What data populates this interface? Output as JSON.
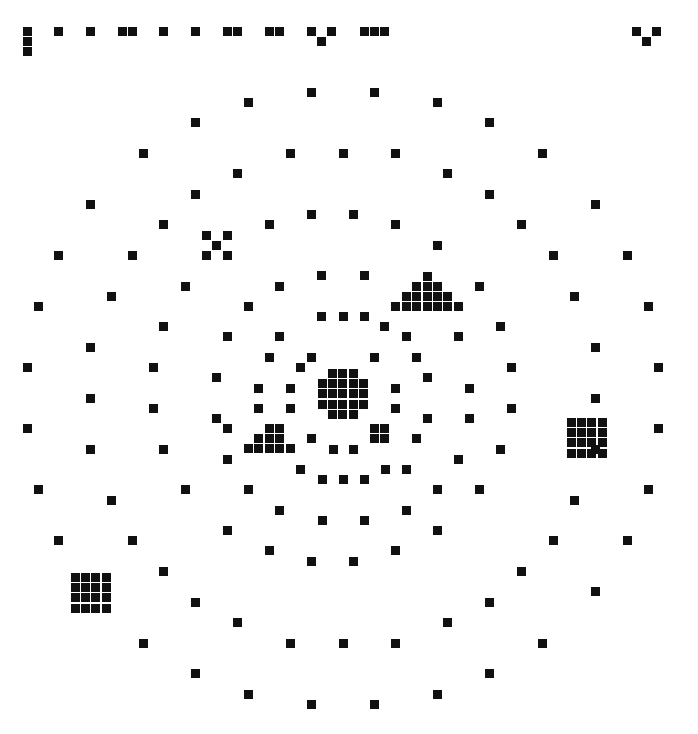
{
  "canvas": {
    "width": 698,
    "height": 734,
    "background": "#ffffff",
    "ink": "#111111",
    "square_size": 9
  },
  "header_row": {
    "description": "row of markers along top edge",
    "points": [
      [
        27,
        31
      ],
      [
        27,
        41
      ],
      [
        27,
        51
      ],
      [
        58,
        31
      ],
      [
        90,
        31
      ],
      [
        122,
        31
      ],
      [
        132,
        31
      ],
      [
        163,
        31
      ],
      [
        195,
        31
      ],
      [
        227,
        31
      ],
      [
        237,
        31
      ],
      [
        269,
        31
      ],
      [
        279,
        31
      ],
      [
        311,
        31
      ],
      [
        321,
        41
      ],
      [
        331,
        31
      ],
      [
        364,
        31
      ],
      [
        374,
        31
      ],
      [
        384,
        31
      ],
      [
        636,
        31
      ],
      [
        646,
        41
      ],
      [
        656,
        31
      ]
    ]
  },
  "scatter_points": [
    [
      311,
      92
    ],
    [
      374,
      92
    ],
    [
      248,
      102
    ],
    [
      437,
      102
    ],
    [
      195,
      122
    ],
    [
      489,
      122
    ],
    [
      143,
      153
    ],
    [
      290,
      153
    ],
    [
      343,
      153
    ],
    [
      395,
      153
    ],
    [
      542,
      153
    ],
    [
      237,
      173
    ],
    [
      447,
      173
    ],
    [
      195,
      194
    ],
    [
      489,
      194
    ],
    [
      90,
      204
    ],
    [
      595,
      204
    ],
    [
      311,
      214
    ],
    [
      353,
      214
    ],
    [
      163,
      224
    ],
    [
      269,
      224
    ],
    [
      395,
      224
    ],
    [
      521,
      224
    ],
    [
      437,
      245
    ],
    [
      58,
      255
    ],
    [
      132,
      255
    ],
    [
      227,
      255
    ],
    [
      553,
      255
    ],
    [
      627,
      255
    ],
    [
      321,
      275
    ],
    [
      364,
      275
    ],
    [
      185,
      286
    ],
    [
      279,
      286
    ],
    [
      479,
      286
    ],
    [
      111,
      296
    ],
    [
      574,
      296
    ],
    [
      38,
      306
    ],
    [
      248,
      306
    ],
    [
      648,
      306
    ],
    [
      321,
      316
    ],
    [
      343,
      316
    ],
    [
      364,
      316
    ],
    [
      163,
      326
    ],
    [
      384,
      326
    ],
    [
      500,
      326
    ],
    [
      279,
      336
    ],
    [
      227,
      336
    ],
    [
      458,
      336
    ],
    [
      90,
      347
    ],
    [
      406,
      336
    ],
    [
      269,
      357
    ],
    [
      311,
      357
    ],
    [
      374,
      357
    ],
    [
      416,
      357
    ],
    [
      595,
      347
    ],
    [
      27,
      367
    ],
    [
      153,
      367
    ],
    [
      300,
      367
    ],
    [
      511,
      367
    ],
    [
      658,
      367
    ],
    [
      216,
      377
    ],
    [
      427,
      377
    ],
    [
      469,
      388
    ],
    [
      258,
      388
    ],
    [
      290,
      388
    ],
    [
      395,
      388
    ],
    [
      90,
      398
    ],
    [
      595,
      398
    ],
    [
      153,
      408
    ],
    [
      258,
      408
    ],
    [
      290,
      408
    ],
    [
      395,
      408
    ],
    [
      427,
      418
    ],
    [
      511,
      408
    ],
    [
      216,
      418
    ],
    [
      469,
      418
    ],
    [
      27,
      428
    ],
    [
      658,
      428
    ],
    [
      227,
      428
    ],
    [
      279,
      428
    ],
    [
      311,
      438
    ],
    [
      416,
      438
    ],
    [
      90,
      449
    ],
    [
      163,
      449
    ],
    [
      500,
      449
    ],
    [
      595,
      449
    ],
    [
      333,
      449
    ],
    [
      353,
      449
    ],
    [
      227,
      459
    ],
    [
      458,
      459
    ],
    [
      300,
      469
    ],
    [
      385,
      469
    ],
    [
      406,
      469
    ],
    [
      322,
      479
    ],
    [
      343,
      479
    ],
    [
      364,
      479
    ],
    [
      38,
      489
    ],
    [
      185,
      489
    ],
    [
      248,
      489
    ],
    [
      437,
      489
    ],
    [
      479,
      489
    ],
    [
      648,
      489
    ],
    [
      111,
      500
    ],
    [
      574,
      500
    ],
    [
      279,
      510
    ],
    [
      406,
      510
    ],
    [
      322,
      520
    ],
    [
      364,
      520
    ],
    [
      227,
      530
    ],
    [
      437,
      530
    ],
    [
      58,
      540
    ],
    [
      132,
      540
    ],
    [
      553,
      540
    ],
    [
      627,
      540
    ],
    [
      269,
      550
    ],
    [
      395,
      550
    ],
    [
      311,
      561
    ],
    [
      353,
      561
    ],
    [
      521,
      571
    ],
    [
      163,
      571
    ],
    [
      595,
      591
    ],
    [
      195,
      602
    ],
    [
      489,
      602
    ],
    [
      237,
      622
    ],
    [
      447,
      622
    ],
    [
      143,
      643
    ],
    [
      290,
      643
    ],
    [
      343,
      643
    ],
    [
      395,
      643
    ],
    [
      542,
      643
    ],
    [
      195,
      673
    ],
    [
      489,
      673
    ],
    [
      248,
      694
    ],
    [
      437,
      694
    ],
    [
      311,
      704
    ],
    [
      374,
      704
    ]
  ],
  "clusters": [
    {
      "name": "x-cross",
      "points": [
        [
          206,
          235
        ],
        [
          227,
          235
        ],
        [
          216,
          245
        ],
        [
          206,
          255
        ],
        [
          227,
          255
        ]
      ]
    },
    {
      "name": "triangle-upper-right",
      "points": [
        [
          427,
          276
        ],
        [
          416,
          286
        ],
        [
          427,
          286
        ],
        [
          437,
          286
        ],
        [
          406,
          296
        ],
        [
          416,
          296
        ],
        [
          427,
          296
        ],
        [
          437,
          296
        ],
        [
          447,
          296
        ],
        [
          395,
          306
        ],
        [
          406,
          306
        ],
        [
          416,
          306
        ],
        [
          427,
          306
        ],
        [
          437,
          306
        ],
        [
          447,
          306
        ],
        [
          458,
          306
        ]
      ]
    },
    {
      "name": "center-octagon",
      "origin": [
        322,
        373
      ],
      "pattern": [
        "0111",
        "11111",
        "11111",
        "11111",
        "0111"
      ]
    },
    {
      "name": "small-square-2x2",
      "points": [
        [
          374,
          428
        ],
        [
          384,
          428
        ],
        [
          374,
          438
        ],
        [
          384,
          438
        ]
      ]
    },
    {
      "name": "triangle-lower-left",
      "points": [
        [
          269,
          428
        ],
        [
          258,
          438
        ],
        [
          269,
          438
        ],
        [
          279,
          438
        ],
        [
          248,
          448
        ],
        [
          258,
          448
        ],
        [
          269,
          448
        ],
        [
          279,
          448
        ],
        [
          290,
          448
        ]
      ]
    },
    {
      "name": "grid-4x4-right",
      "origin": [
        571,
        422
      ],
      "rows": 4,
      "cols": 4
    },
    {
      "name": "grid-4x4-left",
      "origin": [
        75,
        577
      ],
      "rows": 4,
      "cols": 4
    }
  ]
}
